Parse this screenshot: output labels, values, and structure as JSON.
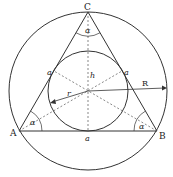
{
  "diagram": {
    "vertices": {
      "A": "A",
      "B": "B",
      "C": "C"
    },
    "labels": {
      "side_top_left": "a",
      "side_top_right": "a",
      "side_bottom": "a",
      "height": "h",
      "inradius": "r",
      "circumradius": "R",
      "angle_C": "α",
      "angle_A": "α",
      "angle_B": "α"
    },
    "colors": {
      "stroke": "#333333",
      "dashed": "#555555",
      "background": "#ffffff"
    }
  }
}
